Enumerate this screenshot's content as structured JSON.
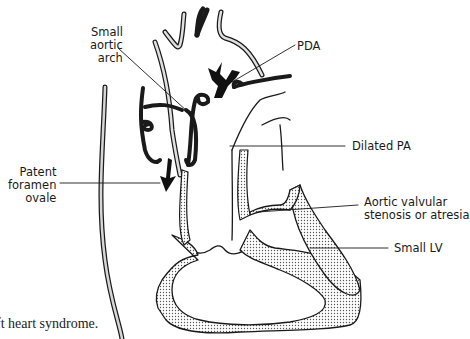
{
  "figure": {
    "caption_fragment": "ft heart syndrome.",
    "colors": {
      "ink": "#1a1a1a",
      "stipple_fill": "#c9c9c9",
      "background": "#ffffff"
    }
  },
  "labels": {
    "small_aortic_arch": "Small\naortic\narch",
    "pda": "PDA",
    "dilated_pa": "Dilated PA",
    "patent_foramen_ovale": "Patent\nforamen\novale",
    "aortic_valvular": "Aortic valvular\nstenosis or atresia",
    "small_lv": "Small LV"
  },
  "icons": {
    "flow_arrow_pda": "double-headed-forked-arrow",
    "flow_arrow_foramen": "curved-down-arrow"
  }
}
